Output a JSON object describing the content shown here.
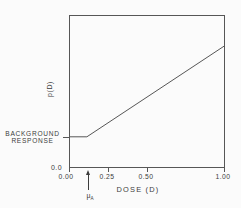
{
  "figure": {
    "ylabel": "p(D)",
    "xlabel": "DOSE (D)",
    "origin_y_label": "0.0",
    "x_ticks": [
      "0.00",
      "0.25",
      "0.50",
      "1.00"
    ],
    "background_line1": "BACKGROUND",
    "background_line2": "RESPONSE",
    "threshold": {
      "symbol": "μ",
      "subscript": "A"
    }
  },
  "colors": {
    "ink": "#3c3c3c",
    "line": "#565656",
    "background": "#fbfbfb"
  },
  "chart_data": {
    "type": "line",
    "title": "",
    "xlabel": "DOSE (D)",
    "ylabel": "p(D)",
    "xlim": [
      0,
      1.0
    ],
    "ylim_relative": [
      0,
      1.0
    ],
    "x_tick_values": [
      0,
      0.25,
      0.5,
      1.0
    ],
    "x_tick_labels": [
      "0.00",
      "0.25",
      "0.50",
      "1.00"
    ],
    "y_tick_labels": [
      "0.0"
    ],
    "grid": false,
    "legend": false,
    "series": [
      {
        "name": "threshold dose-response curve",
        "points_x": [
          0,
          0.11,
          1.0
        ],
        "points_y_relative": [
          0.2,
          0.2,
          0.8
        ],
        "note": "y-axis unlabeled except 0.0; y values are relative fractions of axis height; flat background-response segment then linear rise"
      }
    ],
    "annotations": [
      {
        "type": "axis-callout",
        "text": "BACKGROUND RESPONSE",
        "y_relative": 0.2
      },
      {
        "type": "arrow-marker",
        "label": "μA",
        "x": 0.12,
        "pointing": "up-at-x-axis"
      }
    ]
  }
}
